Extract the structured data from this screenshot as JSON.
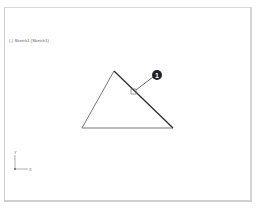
{
  "viewport": {
    "label": "(-) Sketch1 (Sketch1)"
  },
  "sketch": {
    "shape": "triangle",
    "vertices": [
      [
        114,
        71
      ],
      [
        82,
        128
      ],
      [
        173,
        128
      ]
    ],
    "line_color": "#333333",
    "emphasized_edge": "right"
  },
  "callout": {
    "number": "1",
    "circle_center": [
      157,
      75
    ],
    "marker_center": [
      133,
      91
    ],
    "color": "#222222"
  },
  "triad": {
    "x_label": "X",
    "y_label": "Y"
  }
}
